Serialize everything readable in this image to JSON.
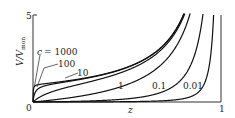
{
  "chart_data": {
    "type": "line",
    "title": "",
    "xlabel": "z",
    "ylabel": "V/V_mon",
    "ylabel_main": "V/V",
    "ylabel_sub": "mon",
    "xlim": [
      0,
      1
    ],
    "ylim": [
      0,
      5
    ],
    "x_ticks": [
      "0",
      "1"
    ],
    "y_ticks": [
      "0",
      "5"
    ],
    "grid": false,
    "legend": "inline labels",
    "equation": "V/V_mon = c z / ((1 - z)(1 - z + c z))",
    "series": [
      {
        "name": "c = 1000",
        "label": "c = 1000",
        "c": 1000
      },
      {
        "name": "100",
        "label": "100",
        "c": 100
      },
      {
        "name": "10",
        "label": "10",
        "c": 10
      },
      {
        "name": "1",
        "label": "1",
        "c": 1
      },
      {
        "name": "0.1",
        "label": "0.1",
        "c": 0.1
      },
      {
        "name": "0.01",
        "label": "0.01",
        "c": 0.01
      }
    ]
  },
  "labels": {
    "y_top": "5",
    "origin": "0",
    "x_right": "1",
    "x_axis": "z",
    "y_axis_main": "V/V",
    "y_axis_sub": "mon",
    "c_prefix": "c",
    "c1000": "= 1000",
    "c100": "100",
    "c10": "10",
    "c1": "1",
    "c01": "0.1",
    "c001": "0.01"
  }
}
